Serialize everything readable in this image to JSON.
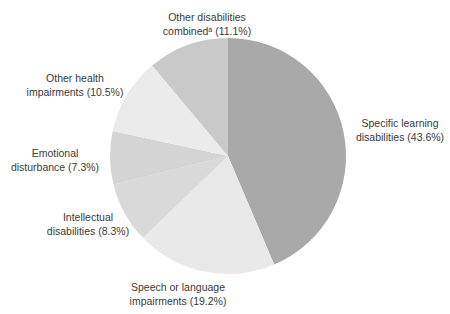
{
  "chart_data": {
    "type": "pie",
    "title": "",
    "start_angle_deg": 0,
    "direction": "clockwise",
    "slices": [
      {
        "label": "Specific learning disabilities",
        "value": 43.6,
        "color": "#a9a9a9"
      },
      {
        "label": "Speech or language impairments",
        "value": 19.2,
        "color": "#e9e9e9"
      },
      {
        "label": "Intellectual disabilities",
        "value": 8.3,
        "color": "#d9d9d9"
      },
      {
        "label": "Emotional disturbance",
        "value": 7.3,
        "color": "#d4d4d4"
      },
      {
        "label": "Other health impairments",
        "value": 10.5,
        "color": "#ebebeb"
      },
      {
        "label": "Other disabilities combinedᵃ",
        "value": 11.1,
        "color": "#c9c9c9"
      }
    ]
  },
  "labels": {
    "sld": {
      "line1": "Specific learning",
      "line2": "disabilities (43.6%)"
    },
    "speech": {
      "line1": "Speech or language",
      "line2": "impairments (19.2%)"
    },
    "intellectual": {
      "line1": "Intellectual",
      "line2": "disabilities (8.3%)"
    },
    "emotional": {
      "line1": "Emotional",
      "line2": "disturbance (7.3%)"
    },
    "health": {
      "line1": "Other health",
      "line2": "impairments (10.5%)"
    },
    "combined": {
      "line1": "Other disabilities",
      "line2": "combinedᵃ (11.1%)"
    }
  }
}
